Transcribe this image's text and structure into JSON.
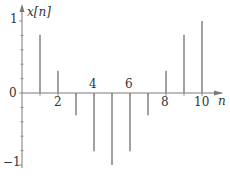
{
  "chart_data": {
    "type": "stem",
    "title": "",
    "xlabel": "n",
    "ylabel": "x[n]",
    "x": [
      1,
      2,
      3,
      4,
      5,
      6,
      7,
      8,
      9,
      10
    ],
    "values": [
      0.81,
      0.31,
      -0.31,
      -0.81,
      -1.0,
      -0.81,
      -0.31,
      0.31,
      0.81,
      1.0
    ],
    "xticks_labeled": [
      2,
      4,
      6,
      8,
      10
    ],
    "yticks_labeled": [
      -1,
      0,
      1
    ],
    "ylim": [
      -1.1,
      1.15
    ],
    "xlim": [
      0,
      11
    ],
    "grid": false,
    "legend": null,
    "colors": {
      "stem": "#8a8a8a",
      "axis": "#7a7a7a",
      "text": "#333333"
    }
  },
  "labels": {
    "y_axis": "x[n]",
    "x_axis": "n",
    "y1": "1",
    "y0": "0",
    "ym1": "−1",
    "x2": "2",
    "x4": "4",
    "x6": "6",
    "x8": "8",
    "x10": "10"
  }
}
